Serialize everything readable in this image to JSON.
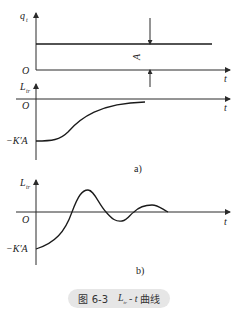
{
  "figure": {
    "caption_prefix": "图 6-3",
    "caption_var": "L",
    "caption_var_sub": "tr",
    "caption_mid": "- t",
    "caption_suffix": "曲线"
  },
  "panel_top": {
    "y_label": "q",
    "y_label_sub": "t",
    "x_label": "t",
    "origin": "O",
    "step_label": "A"
  },
  "panel_a": {
    "y_label": "L",
    "y_label_sub": "tr",
    "x_label": "t",
    "origin": "O",
    "start_label": "−K′A",
    "tag": "a)"
  },
  "panel_b": {
    "y_label": "L",
    "y_label_sub": "tr",
    "x_label": "t",
    "origin": "O",
    "start_label": "−K′A",
    "tag": "b)"
  }
}
